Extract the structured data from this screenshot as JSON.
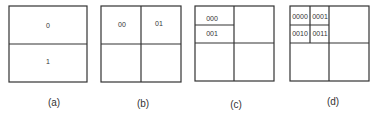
{
  "panels": [
    {
      "caption": "(a)",
      "cells": [
        "0",
        "1"
      ]
    },
    {
      "caption": "(b)",
      "cells": [
        "00",
        "01"
      ]
    },
    {
      "caption": "(c)",
      "cells": [
        "000",
        "001"
      ]
    },
    {
      "caption": "(d)",
      "cells": [
        "0000",
        "0001",
        "0010",
        "0011"
      ]
    }
  ]
}
